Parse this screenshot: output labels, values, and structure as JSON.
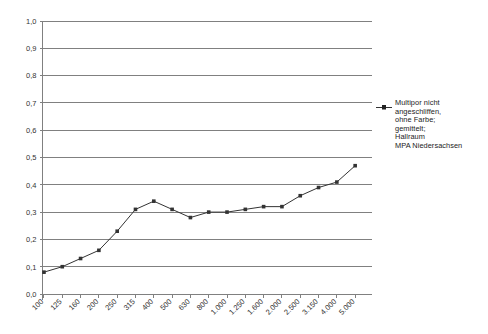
{
  "chart_data": {
    "type": "line",
    "title": "",
    "subtitle": "",
    "xlabel": "",
    "ylabel": "",
    "categories": [
      "100",
      "125",
      "160",
      "200",
      "250",
      "315",
      "400",
      "500",
      "630",
      "800",
      "1.000",
      "1.250",
      "1.600",
      "2.000",
      "2.500",
      "3.150",
      "4.000",
      "5.000"
    ],
    "values": [
      0.08,
      0.1,
      0.13,
      0.16,
      0.23,
      0.31,
      0.34,
      0.31,
      0.28,
      0.3,
      0.3,
      0.31,
      0.32,
      0.32,
      0.36,
      0.39,
      0.41,
      0.47
    ],
    "series": [
      {
        "name": "Multipor nicht angeschliffen, ohne Farbe; gemittelt; Hallraum MPA Niedersachsen",
        "values": [
          0.08,
          0.1,
          0.13,
          0.16,
          0.23,
          0.31,
          0.34,
          0.31,
          0.28,
          0.3,
          0.3,
          0.31,
          0.32,
          0.32,
          0.36,
          0.39,
          0.41,
          0.47
        ],
        "color": "#333333",
        "marker": "square"
      }
    ],
    "ylim": [
      0.0,
      1.0
    ],
    "ytick_labels": [
      "1,0",
      "0,9",
      "0,8",
      "0,7",
      "0,6",
      "0,5",
      "0,4",
      "0,3",
      "0,2",
      "0,1",
      "0,0"
    ],
    "ytick_values": [
      1.0,
      0.9,
      0.8,
      0.7,
      0.6,
      0.5,
      0.4,
      0.3,
      0.2,
      0.1,
      0.0
    ],
    "grid": true,
    "grid_axis": "y",
    "legend_position": "right",
    "xtick_rotation": 45
  },
  "legend": {
    "entries": [
      {
        "label": "Multipor nicht\nangeschliffen,\nohne Farbe;\ngemittelt;\nHallraum\nMPA Niedersachsen",
        "color": "#333333"
      }
    ]
  },
  "colors": {
    "grid": "#808080",
    "axis": "#808080",
    "series": "#333333",
    "text": "#333333",
    "background": "#ffffff"
  }
}
